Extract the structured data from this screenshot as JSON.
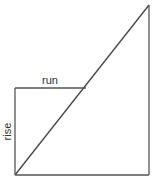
{
  "diagram": {
    "labels": {
      "run": "run",
      "rise": "rise"
    },
    "colors": {
      "stroke": "#444444",
      "background": "#ffffff"
    },
    "shapes": {
      "outer_triangle": {
        "description": "Right triangle with hypotenuse from bottom-left to top-right",
        "points": [
          [
            15,
            175
          ],
          [
            149,
            5
          ],
          [
            149,
            175
          ]
        ]
      },
      "inner_rectangle": {
        "description": "Smaller right triangle legs: rise (vertical) and run (horizontal)",
        "rise_line": [
          [
            15,
            175
          ],
          [
            15,
            88
          ]
        ],
        "run_line": [
          [
            15,
            88
          ],
          [
            86,
            88
          ]
        ]
      }
    }
  }
}
